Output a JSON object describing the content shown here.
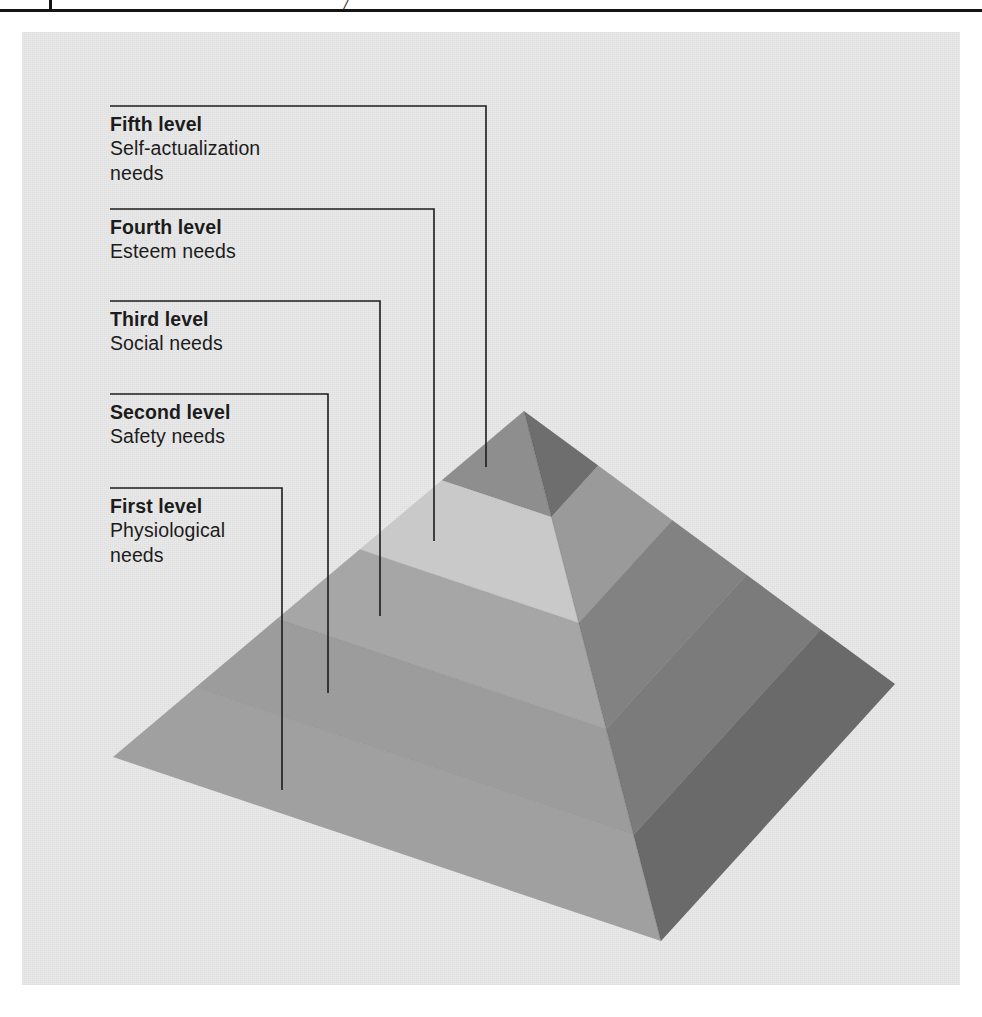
{
  "page": {
    "background_color": "#ffffff",
    "panel_color": "#e9e9e9",
    "rule_color": "#141414",
    "top_mark": "/"
  },
  "diagram": {
    "name": "maslow-hierarchy-of-needs-pyramid",
    "type": "labeled-3d-pyramid",
    "levels": [
      {
        "order": 5,
        "title": "Fifth level",
        "description": "Self-actualization\nneeds",
        "label_x": 110,
        "label_y": 112,
        "rule_y": 106,
        "rule_width": 376,
        "leader_turn_x": 486,
        "leader_end_y": 467
      },
      {
        "order": 4,
        "title": "Fourth level",
        "description": "Esteem needs",
        "label_x": 110,
        "label_y": 215,
        "rule_y": 209,
        "rule_width": 324,
        "leader_turn_x": 434,
        "leader_end_y": 541
      },
      {
        "order": 3,
        "title": "Third level",
        "description": "Social needs",
        "label_x": 110,
        "label_y": 307,
        "rule_y": 301,
        "rule_width": 270,
        "leader_turn_x": 380,
        "leader_end_y": 616
      },
      {
        "order": 2,
        "title": "Second level",
        "description": "Safety needs",
        "label_x": 110,
        "label_y": 400,
        "rule_y": 394,
        "rule_width": 218,
        "leader_turn_x": 328,
        "leader_end_y": 693
      },
      {
        "order": 1,
        "title": "First level",
        "description": "Physiological\nneeds",
        "label_x": 110,
        "label_y": 494,
        "rule_y": 488,
        "rule_width": 172,
        "leader_turn_x": 282,
        "leader_end_y": 790
      }
    ],
    "pyramid": {
      "apex": [
        524,
        411
      ],
      "left_corner": [
        113,
        757
      ],
      "bottom_corner": [
        661,
        941
      ],
      "right_corner": [
        895,
        684
      ],
      "band_count": 5,
      "left_face_colors": [
        "#8e8e8e",
        "#c9c9c9",
        "#a6a6a6",
        "#9c9c9c",
        "#a0a0a0"
      ],
      "right_face_colors": [
        "#6e6e6e",
        "#9a9a9a",
        "#828282",
        "#7b7b7b",
        "#6a6a6a"
      ],
      "outline_color": "#7a7a7a"
    },
    "leader_line_color": "#1c1c1c",
    "leader_line_width": 1.6
  }
}
